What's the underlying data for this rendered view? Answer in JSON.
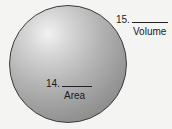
{
  "figure": {
    "shape": "sphere",
    "labels": [
      {
        "number": "15.",
        "caption": "Volume"
      },
      {
        "number": "14.",
        "caption": "Area"
      }
    ]
  }
}
